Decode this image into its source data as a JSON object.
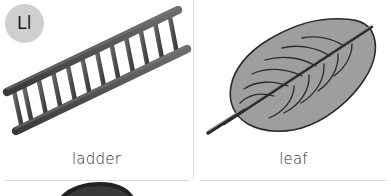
{
  "page": {
    "background_color": "#ffffff",
    "width": 391,
    "height": 196,
    "divider_color": "#d9d9d9"
  },
  "letter_badge": {
    "text": "Ll",
    "background_color": "#cfcfcf",
    "text_color": "#1a1a1a",
    "icon_name": "letter-badge-circle"
  },
  "cards": [
    {
      "id": "ladder",
      "label": "ladder",
      "illustration_name": "ladder-illustration",
      "illustration_fill": "#5b5b5b",
      "illustration_stroke": "#2e2e2e",
      "rung_count": 12
    },
    {
      "id": "leaf",
      "label": "leaf",
      "illustration_name": "leaf-illustration",
      "illustration_fill": "#9e9e9e",
      "illustration_stroke": "#2b2b2b",
      "vein_count": 11
    }
  ],
  "next_row_peek": {
    "illustration_name": "partial-object-top",
    "fill": "#232323"
  }
}
